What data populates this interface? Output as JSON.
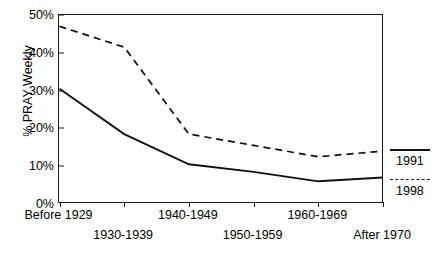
{
  "chart_data": {
    "type": "line",
    "title": "",
    "xlabel": "",
    "ylabel": "% PRAY Weekly",
    "categories": [
      "Before 1929",
      "1930-1939",
      "1940-1949",
      "1950-1959",
      "1960-1969",
      "After 1970"
    ],
    "series": [
      {
        "name": "1991",
        "style": "solid",
        "values": [
          30.5,
          18.5,
          10.5,
          8.5,
          6.0,
          7.0
        ]
      },
      {
        "name": "1998",
        "style": "dashed",
        "values": [
          47.0,
          41.5,
          18.5,
          15.5,
          12.5,
          14.0
        ]
      }
    ],
    "ylim": [
      0,
      50
    ],
    "ytick_labels": [
      "0%",
      "10%",
      "20%",
      "30%",
      "40%",
      "50%"
    ],
    "ytick_values": [
      0,
      10,
      20,
      30,
      40,
      50
    ],
    "grid": false,
    "legend_position": "right"
  },
  "axis": {
    "y_title": "% PRAY Weekly",
    "y_ticks": [
      "50%",
      "40%",
      "30%",
      "20%",
      "10%",
      "0%"
    ],
    "x_labels_row1": [
      "Before 1929",
      "1940-1949",
      "1960-1969"
    ],
    "x_labels_row2": [
      "1930-1939",
      "1950-1959",
      "After 1970"
    ]
  },
  "legend": {
    "entries": [
      {
        "label": "1991",
        "style": "solid"
      },
      {
        "label": "1998",
        "style": "dashed"
      }
    ]
  },
  "colors": {
    "line": "#111111",
    "axis": "#1a1a1a",
    "background": "#ffffff"
  }
}
